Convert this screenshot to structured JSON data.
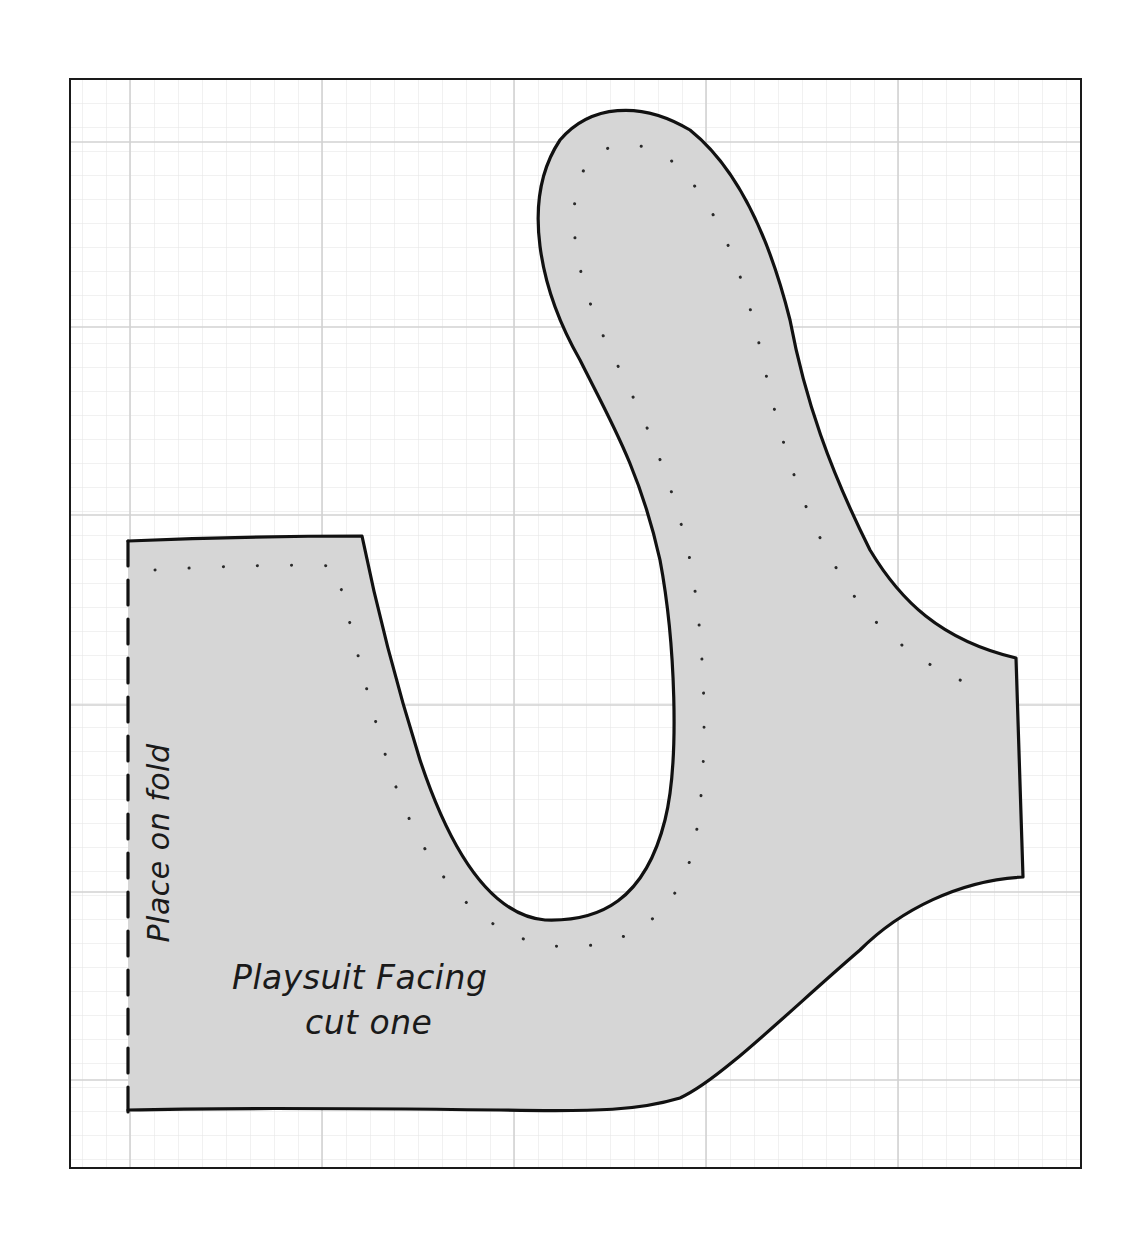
{
  "diagram": {
    "type": "sewing-pattern",
    "piece_name": "Playsuit Facing",
    "instruction": "cut one",
    "fold_label": "Place on fold",
    "colors": {
      "background": "#ffffff",
      "frame": "#1a1a1a",
      "grid_minor": "#e2e2e2",
      "grid_major": "#cfcfcf",
      "piece_fill": "#d6d6d6",
      "outline": "#111111",
      "stitch_dots": "#2a2a2a"
    },
    "grid": {
      "minor_spacing_px": 24,
      "major_every": 8
    },
    "elements": {
      "cutting_line": "solid outline",
      "fold_line": "dashed line along left edge",
      "stitch_line": "dotted line inside piece"
    }
  }
}
